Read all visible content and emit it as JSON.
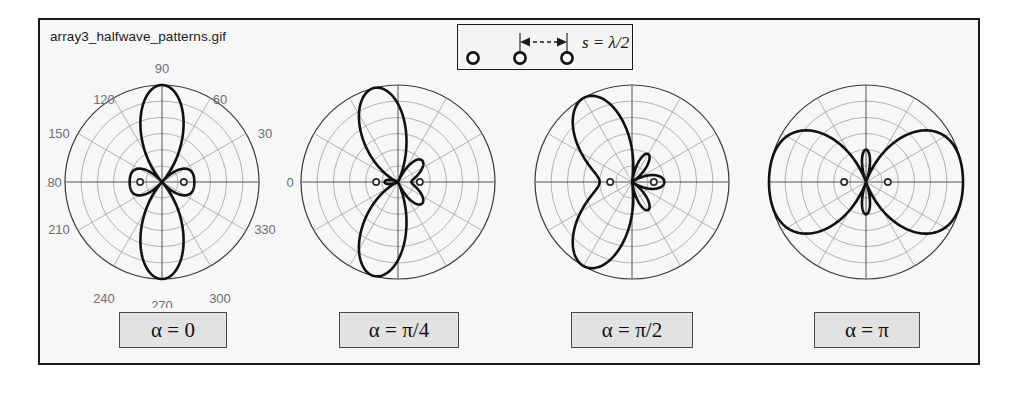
{
  "figure": {
    "file_caption": "array3_halfwave_patterns.gif",
    "background_color": "#f7f7f7",
    "border_color": "#1a1a1a",
    "curve_color": "#111111",
    "grid_color": "#9a9aa2",
    "label_color": "#6e6e76"
  },
  "legend": {
    "spacing_label": "s = λ/2",
    "element_count": 3,
    "arrow_style": "dashed-double-headed",
    "marker_shape": "circle"
  },
  "chart_data": [
    {
      "type": "line",
      "subtype": "polar",
      "title": "α = 0",
      "alpha_label": "α = 0",
      "alpha_radians": 0,
      "elements": 3,
      "spacing": "λ/2",
      "rmax": 1.0,
      "radial_rings": 6,
      "angular_spokes_deg": 30,
      "grid": true,
      "theta_ticks_deg": [
        0,
        30,
        60,
        90,
        120,
        150,
        180,
        210,
        240,
        270,
        300,
        330
      ],
      "tick_labels": [
        "0",
        "30",
        "60",
        "90",
        "120",
        "150",
        "180",
        "210",
        "240",
        "270",
        "300",
        "330"
      ],
      "tick_labels_shown": [
        "60",
        "90",
        "120",
        "150",
        "180",
        "210",
        "240",
        "270",
        "300",
        "330",
        "30"
      ],
      "theta_deg": [
        0,
        10,
        20,
        30,
        40,
        50,
        60,
        70,
        80,
        90,
        100,
        110,
        120,
        130,
        140,
        150,
        160,
        170,
        180,
        190,
        200,
        210,
        220,
        230,
        240,
        250,
        260,
        270,
        280,
        290,
        300,
        310,
        320,
        330,
        340,
        350
      ],
      "r": [
        0.04,
        0.07,
        0.16,
        0.3,
        0.47,
        0.66,
        0.82,
        0.94,
        0.99,
        1.0,
        0.99,
        0.94,
        0.82,
        0.66,
        0.47,
        0.3,
        0.16,
        0.07,
        0.04,
        0.07,
        0.16,
        0.3,
        0.47,
        0.66,
        0.82,
        0.94,
        0.99,
        1.0,
        0.99,
        0.94,
        0.82,
        0.66,
        0.47,
        0.3,
        0.16,
        0.07
      ],
      "main_lobe_deg": [
        90,
        270
      ],
      "side_lobe_deg": [
        0,
        180
      ],
      "description": "broadside pattern: major lobes at 90 and 270, small sidelobes at 0 and 180"
    },
    {
      "type": "line",
      "subtype": "polar",
      "title": "α = π/4",
      "alpha_label": "α = π/4",
      "alpha_radians": 0.7854,
      "elements": 3,
      "spacing": "λ/2",
      "rmax": 1.0,
      "radial_rings": 6,
      "angular_spokes_deg": 30,
      "grid": true,
      "tick_labels_shown": [
        "0"
      ],
      "main_lobe_deg": [
        104,
        256
      ],
      "side_lobe_deg": [
        0
      ],
      "description": "main lobes tilted toward upper-left and lower-left, sidelobes toward 0 degrees"
    },
    {
      "type": "line",
      "subtype": "polar",
      "title": "α = π/2",
      "alpha_label": "α = π/2",
      "alpha_radians": 1.5708,
      "elements": 3,
      "spacing": "λ/2",
      "rmax": 1.0,
      "radial_rings": 6,
      "angular_spokes_deg": 30,
      "grid": true,
      "tick_labels_shown": [],
      "main_lobe_deg": [
        120,
        240
      ],
      "side_lobe_deg": [
        0,
        35,
        325
      ],
      "description": "broad merged lobe toward 180 degrees, compact sidelobes near 0 degrees"
    },
    {
      "type": "line",
      "subtype": "polar",
      "title": "α = π",
      "alpha_label": "α = π",
      "alpha_radians": 3.1416,
      "elements": 3,
      "spacing": "λ/2",
      "rmax": 1.0,
      "radial_rings": 6,
      "angular_spokes_deg": 30,
      "grid": true,
      "tick_labels_shown": [],
      "main_lobe_deg": [
        0,
        180
      ],
      "side_lobe_deg": [
        90,
        270
      ],
      "description": "endfire pattern: major lobes toward 0 and 180, thin narrow lobes at 90 and 270"
    }
  ],
  "captions": [
    {
      "label": "α = 0"
    },
    {
      "label": "α = π/4"
    },
    {
      "label": "α = π/2"
    },
    {
      "label": "α = π"
    }
  ]
}
